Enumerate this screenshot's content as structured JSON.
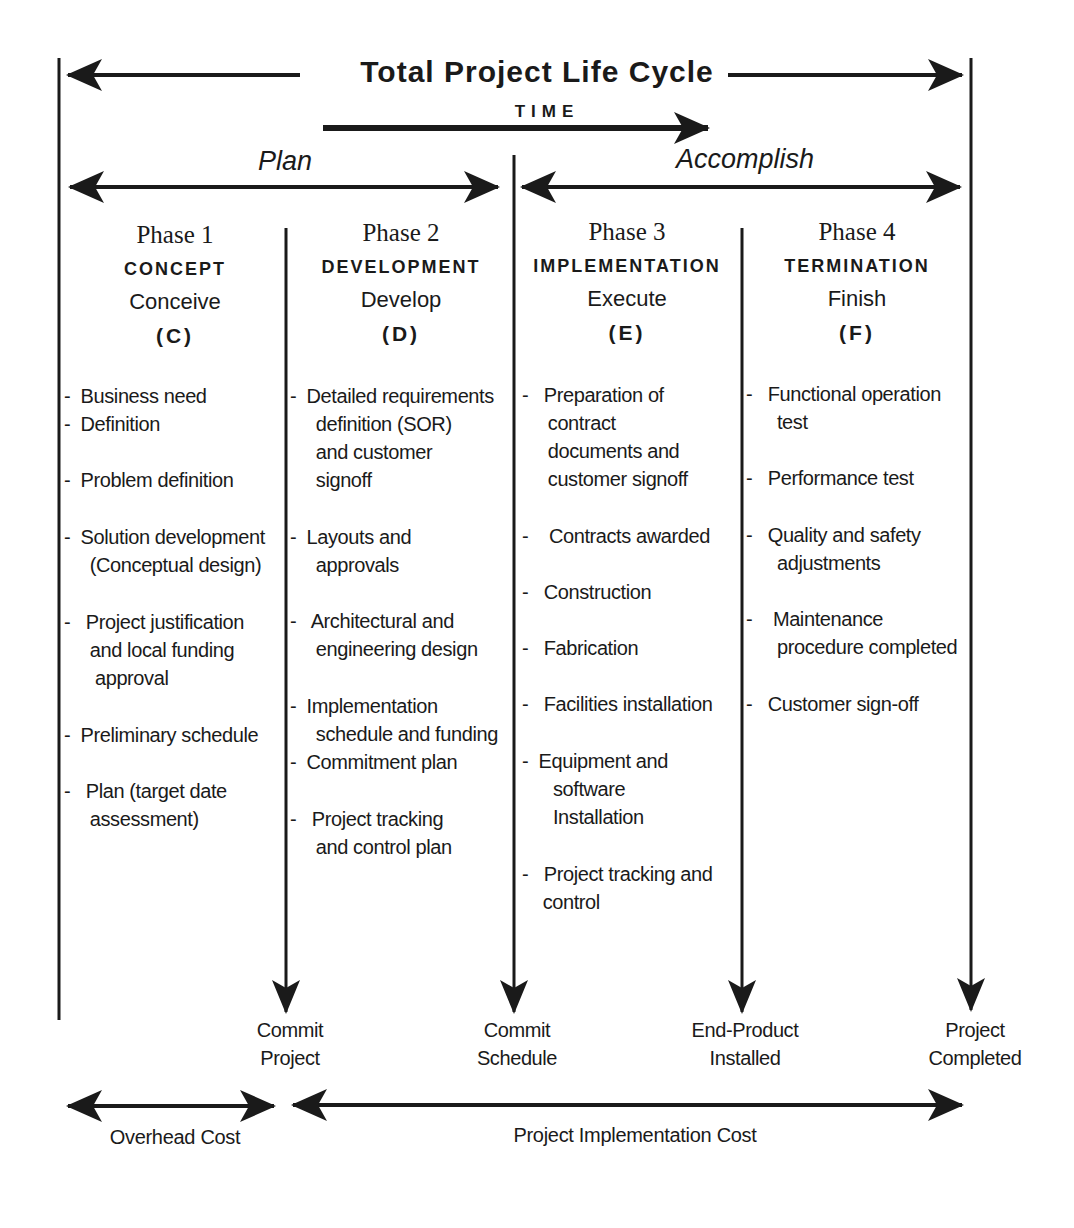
{
  "header": {
    "title": "Total Project Life Cycle",
    "time_label": "TIME"
  },
  "halves": {
    "plan": "Plan",
    "accomplish": "Accomplish"
  },
  "phases": [
    {
      "number": "Phase 1",
      "name": "CONCEPT",
      "verb": "Conceive",
      "code": "(C)",
      "items": [
        "-  Business need",
        "-  Definition",
        "-  Problem definition",
        "-  Solution development\n     (Conceptual design)",
        "-   Project justification\n     and local funding\n      approval",
        "-  Preliminary schedule",
        "-   Plan (target date\n     assessment)"
      ]
    },
    {
      "number": "Phase 2",
      "name": "DEVELOPMENT",
      "verb": "Develop",
      "code": "(D)",
      "items": [
        "-  Detailed requirements\n     definition (SOR)\n     and customer\n     signoff",
        "-  Layouts and\n     approvals",
        "-   Architectural and\n     engineering design",
        "-  Implementation\n     schedule and funding",
        "-  Commitment plan",
        "-   Project tracking\n     and control plan"
      ]
    },
    {
      "number": "Phase 3",
      "name": "IMPLEMENTATION",
      "verb": "Execute",
      "code": "(E)",
      "items": [
        "-   Preparation of\n     contract\n     documents and\n     customer signoff",
        "-    Contracts awarded",
        "-   Construction",
        "-   Fabrication",
        "-   Facilities installation",
        "-  Equipment and\n      software\n      Installation",
        "-   Project tracking and\n    control"
      ]
    },
    {
      "number": "Phase 4",
      "name": "TERMINATION",
      "verb": "Finish",
      "code": "(F)",
      "items": [
        "-   Functional operation\n      test",
        "-   Performance test",
        "-   Quality and safety\n      adjustments",
        "-    Maintenance\n      procedure completed",
        "-   Customer sign-off"
      ]
    }
  ],
  "milestones": [
    "Commit\nProject",
    "Commit\nSchedule",
    "End-Product\nInstalled",
    "Project\nCompleted"
  ],
  "costs": {
    "overhead": "Overhead Cost",
    "implementation": "Project Implementation Cost"
  },
  "colors": {
    "ink": "#1a1a1a",
    "background": "#ffffff"
  }
}
